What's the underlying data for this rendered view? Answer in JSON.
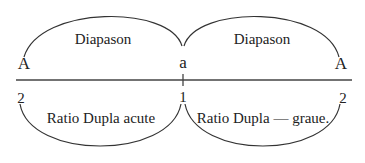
{
  "diagram": {
    "top_arcs": [
      {
        "label": "Diapason"
      },
      {
        "label": "Diapason"
      }
    ],
    "bottom_arcs": [
      {
        "label": "Ratio Dupla acute"
      },
      {
        "label": "Ratio Dupla — graue."
      }
    ],
    "upper_points": [
      "A",
      "a",
      "A"
    ],
    "lower_numbers": [
      "2",
      "1",
      "2"
    ],
    "colors": {
      "stroke": "#333333",
      "text": "#222222",
      "background": "#ffffff"
    }
  }
}
